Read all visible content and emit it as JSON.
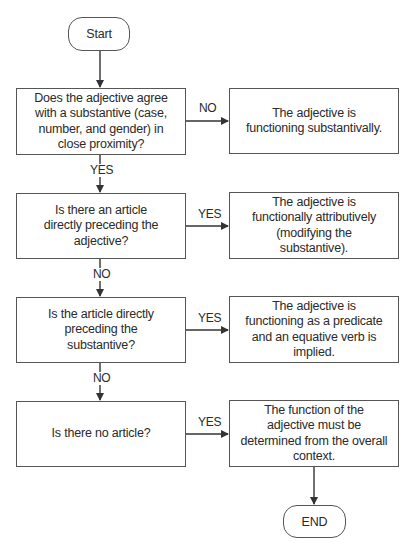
{
  "flowchart": {
    "start": {
      "label": "Start"
    },
    "end": {
      "label": "END"
    },
    "decisions": [
      {
        "question": "Does the adjective agree with a substantive (case, number, and gender) in close proximity?",
        "branch_label": "NO",
        "outcome": "The adjective is functioning substantivally.",
        "next_label": "YES"
      },
      {
        "question": "Is there an article directly preceding the adjective?",
        "branch_label": "YES",
        "outcome": "The adjective is functionally attributively (modifying the substantive).",
        "next_label": "NO"
      },
      {
        "question": "Is the article directly preceding the substantive?",
        "branch_label": "YES",
        "outcome": "The adjective is functioning as a predicate and an equative verb is implied.",
        "next_label": "NO"
      },
      {
        "question": "Is there no article?",
        "branch_label": "YES",
        "outcome": "The function of the adjective must be determined from the overall context."
      }
    ]
  }
}
